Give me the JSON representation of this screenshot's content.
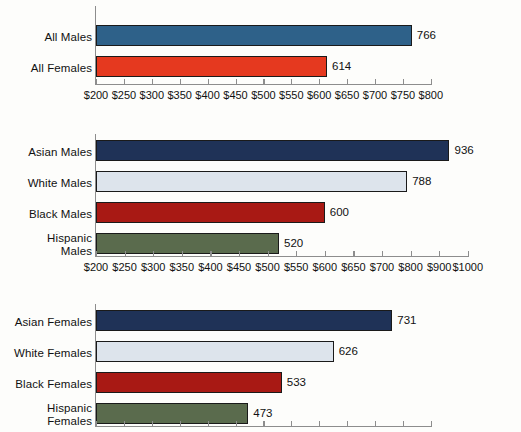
{
  "chart_data": [
    {
      "id": "all",
      "type": "bar",
      "orientation": "horizontal",
      "title": "",
      "xlabel": "",
      "ylabel": "",
      "grid": false,
      "legend": "none",
      "categories": [
        "All Males",
        "All Females"
      ],
      "values": [
        766,
        614
      ],
      "value_labels": [
        "766",
        "614"
      ],
      "colors": [
        "#2e6189",
        "#e5391f"
      ],
      "axis_prefix": "$",
      "axis_min": 200,
      "axis_max": 800,
      "axis_ticks": [
        200,
        250,
        300,
        350,
        400,
        450,
        500,
        550,
        600,
        650,
        700,
        750,
        800
      ],
      "tick_labels": [
        "$200",
        "$250",
        "$300",
        "$350",
        "$400",
        "$450",
        "$500",
        "$550",
        "$600",
        "$650",
        "$700",
        "$750",
        "$800"
      ]
    },
    {
      "id": "males",
      "type": "bar",
      "orientation": "horizontal",
      "title": "",
      "xlabel": "",
      "ylabel": "",
      "grid": false,
      "legend": "none",
      "categories": [
        "Asian Males",
        "White Males",
        "Black Males",
        "Hispanic\nMales"
      ],
      "values": [
        936,
        788,
        600,
        520
      ],
      "value_labels": [
        "936",
        "788",
        "600",
        "520"
      ],
      "colors": [
        "#1f3257",
        "#dde4ec",
        "#a81914",
        "#5a6b4d"
      ],
      "axis_prefix": "$",
      "axis_min": 200,
      "axis_max": 1000,
      "axis_note": "broken axis: $50 steps to $700, then $100 steps",
      "axis_ticks": [
        200,
        250,
        300,
        350,
        400,
        450,
        500,
        550,
        600,
        650,
        700,
        800,
        900,
        1000
      ],
      "tick_labels": [
        "$200",
        "$250",
        "$300",
        "$350",
        "$400",
        "$450",
        "$500",
        "$550",
        "$600",
        "$650",
        "$700",
        "$800",
        "$900",
        "$1000"
      ]
    },
    {
      "id": "females",
      "type": "bar",
      "orientation": "horizontal",
      "title": "",
      "xlabel": "",
      "ylabel": "",
      "grid": false,
      "legend": "none",
      "categories": [
        "Asian Females",
        "White Females",
        "Black Females",
        "Hispanic\nFemales"
      ],
      "values": [
        731,
        626,
        533,
        473
      ],
      "value_labels": [
        "731",
        "626",
        "533",
        "473"
      ],
      "colors": [
        "#1f3257",
        "#dde4ec",
        "#a81914",
        "#5a6b4d"
      ],
      "axis_prefix": "$",
      "axis_min": 200,
      "axis_max": 800,
      "axis_ticks": [
        200,
        250,
        300,
        350,
        400,
        450,
        500,
        550,
        600,
        650,
        700,
        750,
        800
      ],
      "tick_labels": [],
      "axis_note": "tick labels cropped below image edge"
    }
  ]
}
